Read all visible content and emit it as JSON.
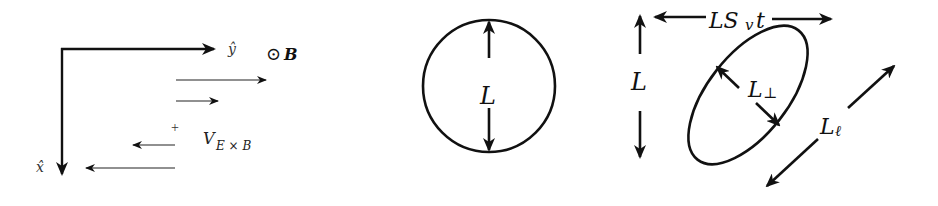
{
  "panel_flow": {
    "x_axis_label": "x̂",
    "y_axis_label": "ŷ",
    "b_field_symbol": "⊙",
    "b_field_label": "B",
    "center_marker": "+",
    "velocity_label_main": "V",
    "velocity_label_sub": "E × B",
    "flow_arrows": [
      {
        "direction": "right",
        "length": 90
      },
      {
        "direction": "right",
        "length": 42
      },
      {
        "direction": "left",
        "length": 43
      },
      {
        "direction": "left",
        "length": 90
      }
    ]
  },
  "panel_circle": {
    "diameter_label": "L"
  },
  "panel_ellipse": {
    "horizontal_label_main": "LS",
    "horizontal_label_sub": "v",
    "horizontal_label_tail": "t",
    "vertical_label": "L",
    "perp_label_main": "L",
    "perp_label_sub": "⊥",
    "parallel_label_main": "L",
    "parallel_label_sub": "ℓ"
  },
  "colors": {
    "ink": "#111111",
    "background": "#ffffff"
  }
}
